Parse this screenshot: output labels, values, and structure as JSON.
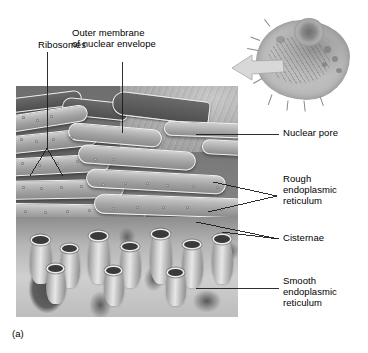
{
  "figure": {
    "caption": "(a)",
    "style": "grayscale-textbook-illustration"
  },
  "labels": {
    "ribosomes": "Ribosomes",
    "outer_membrane": "Outer membrane\nof nuclear envelope",
    "nucleus": "Nucleus",
    "nuclear_pore": "Nuclear pore",
    "rough_er": "Rough\nendoplasmic\nreticulum",
    "cisternae": "Cisternae",
    "smooth_er": "Smooth\nendoplasmic\nreticulum"
  },
  "inset": {
    "name": "whole-cell-overview",
    "arrow": "magnification-arrow"
  },
  "colors": {
    "background": "#ffffff",
    "text": "#000000",
    "leader_line": "#1a1a1a",
    "nucleus_fill": "#b3b3b3",
    "cytoplasm": "#787878",
    "membrane_highlight": "#f2f2f2",
    "smooth_er": "#cfcfcf",
    "nucleus_label_text": "#fafafa"
  }
}
